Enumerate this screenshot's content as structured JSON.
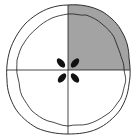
{
  "diagram": {
    "slices_total": 4,
    "slices_shaded": 1,
    "shaded_slice": "top-right",
    "fraction_label": "1/4",
    "colors": {
      "shaded": "#a3a3a3",
      "outline": "#1a1a1a",
      "background": "#ffffff",
      "vents": "#111111"
    }
  }
}
